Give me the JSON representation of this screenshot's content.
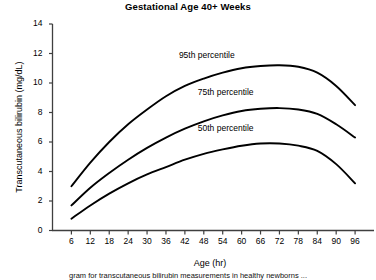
{
  "chart_data": {
    "type": "line",
    "title": "Gestational Age 40+ Weeks",
    "xlabel": "Age (hr)",
    "ylabel": "Transcutaneous bilirubin (mg/dL)",
    "xlim": [
      0,
      102
    ],
    "ylim": [
      0,
      14
    ],
    "xticks": [
      6,
      12,
      18,
      24,
      30,
      36,
      42,
      48,
      54,
      60,
      66,
      72,
      78,
      84,
      90,
      96
    ],
    "yticks": [
      0,
      2,
      4,
      6,
      8,
      10,
      12,
      14
    ],
    "grid": false,
    "legend_position": "inline-annotations",
    "x": [
      6,
      12,
      18,
      24,
      30,
      36,
      42,
      48,
      54,
      60,
      66,
      72,
      78,
      84,
      90,
      96
    ],
    "series": [
      {
        "name": "95th percentile",
        "values": [
          3.0,
          4.6,
          6.0,
          7.2,
          8.2,
          9.1,
          9.8,
          10.3,
          10.7,
          11.0,
          11.15,
          11.2,
          11.1,
          10.7,
          9.8,
          8.5
        ]
      },
      {
        "name": "75th percentile",
        "values": [
          1.7,
          2.9,
          3.9,
          4.8,
          5.6,
          6.3,
          6.9,
          7.4,
          7.8,
          8.1,
          8.25,
          8.3,
          8.2,
          7.9,
          7.2,
          6.3
        ]
      },
      {
        "name": "50th percentile",
        "values": [
          0.8,
          1.7,
          2.5,
          3.2,
          3.8,
          4.3,
          4.8,
          5.2,
          5.5,
          5.75,
          5.9,
          5.9,
          5.75,
          5.4,
          4.5,
          3.2
        ]
      }
    ],
    "annotations": [
      {
        "text": "95th percentile",
        "x": 42,
        "y": 11.8
      },
      {
        "text": "75th percentile",
        "x": 48,
        "y": 9.3
      },
      {
        "text": "50th percentile",
        "x": 48,
        "y": 6.9
      }
    ],
    "colors": {
      "line": "#000000",
      "axis": "#3f3f3f",
      "background": "#ffffff"
    }
  },
  "caption": {
    "text": "gram for transcutaneous bilirubin measurements in healthy newborns ..."
  }
}
